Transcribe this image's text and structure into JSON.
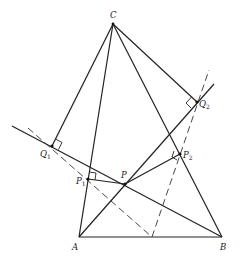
{
  "figure": {
    "type": "geometry-diagram",
    "points": {
      "A": {
        "label": "A"
      },
      "B": {
        "label": "B"
      },
      "C": {
        "label": "C"
      },
      "P": {
        "label": "P"
      },
      "P1": {
        "label": "P",
        "sub": "1"
      },
      "P2": {
        "label": "P",
        "sub": "2"
      },
      "Q1": {
        "label": "Q",
        "sub": "1"
      },
      "Q2": {
        "label": "Q",
        "sub": "2"
      }
    },
    "segments_solid": [
      "AB",
      "AC",
      "BC",
      "CQ1",
      "CQ2",
      "AP",
      "PP1",
      "PP2",
      "BQ1-line",
      "AQ2-line"
    ],
    "segments_dashed": [
      "dashed-left",
      "dashed-right"
    ],
    "right_angles": [
      "Q1",
      "Q2",
      "P1",
      "P2"
    ],
    "stroke_color": "#222222",
    "background": "#ffffff"
  }
}
